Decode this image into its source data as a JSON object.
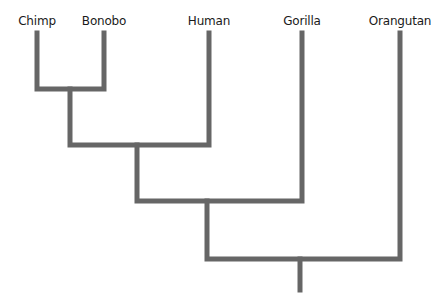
{
  "diagram": {
    "type": "phylogenetic-tree",
    "line_color": "#666666",
    "taxa": [
      {
        "label": "Chimp",
        "x": 37
      },
      {
        "label": "Bonobo",
        "x": 104
      },
      {
        "label": "Human",
        "x": 209
      },
      {
        "label": "Gorilla",
        "x": 302
      },
      {
        "label": "Orangutan",
        "x": 400
      }
    ],
    "clades": [
      {
        "members": [
          "Chimp",
          "Bonobo"
        ]
      },
      {
        "members": [
          "Chimp",
          "Bonobo",
          "Human"
        ]
      },
      {
        "members": [
          "Chimp",
          "Bonobo",
          "Human",
          "Gorilla"
        ]
      },
      {
        "members": [
          "Chimp",
          "Bonobo",
          "Human",
          "Gorilla",
          "Orangutan"
        ]
      }
    ]
  }
}
